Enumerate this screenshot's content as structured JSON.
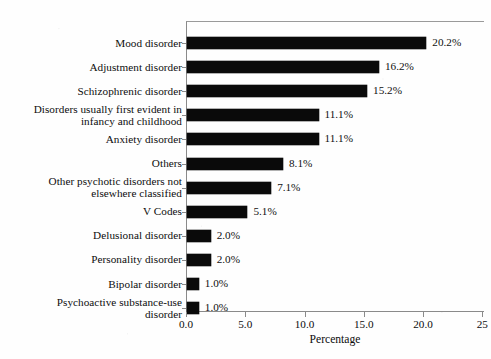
{
  "chart_data": {
    "type": "bar",
    "orientation": "horizontal",
    "title": "",
    "xlabel": "Percentage",
    "ylabel": "",
    "xlim": [
      0.0,
      25.0
    ],
    "xticks": [
      "0.0",
      "5.0",
      "10.0",
      "15.0",
      "20.0",
      "25"
    ],
    "xtick_values": [
      0.0,
      5.0,
      10.0,
      15.0,
      20.0,
      25.0
    ],
    "grid": false,
    "legend": null,
    "bar_color": "#0a0a0a",
    "categories": [
      "Mood disorder",
      "Adjustment disorder",
      "Schizophrenic disorder",
      "Disorders usually first evident in infancy and childhood",
      "Anxiety disorder",
      "Others",
      "Other psychotic disorders not elsewhere classified",
      "V Codes",
      "Delusional disorder",
      "Personality disorder",
      "Bipolar disorder",
      "Psychoactive substance-use disorder"
    ],
    "values": [
      20.2,
      16.2,
      15.2,
      11.1,
      11.1,
      8.1,
      7.1,
      5.1,
      2.0,
      2.0,
      1.0,
      1.0
    ],
    "value_labels": [
      "20.2%",
      "16.2%",
      "15.2%",
      "11.1%",
      "11.1%",
      "8.1%",
      "7.1%",
      "5.1%",
      "2.0%",
      "2.0%",
      "1.0%",
      "1.0%"
    ],
    "rows": [
      {
        "label_line1": "Mood disorder",
        "label_line2": "",
        "value": 20.2,
        "value_label": "20.2%"
      },
      {
        "label_line1": "Adjustment disorder",
        "label_line2": "",
        "value": 16.2,
        "value_label": "16.2%"
      },
      {
        "label_line1": "Schizophrenic disorder",
        "label_line2": "",
        "value": 15.2,
        "value_label": "15.2%"
      },
      {
        "label_line1": "Disorders usually first evident in",
        "label_line2": "infancy and childhood",
        "value": 11.1,
        "value_label": "11.1%"
      },
      {
        "label_line1": "Anxiety disorder",
        "label_line2": "",
        "value": 11.1,
        "value_label": "11.1%"
      },
      {
        "label_line1": "Others",
        "label_line2": "",
        "value": 8.1,
        "value_label": "8.1%"
      },
      {
        "label_line1": "Other psychotic disorders not",
        "label_line2": "elsewhere classified",
        "value": 7.1,
        "value_label": "7.1%"
      },
      {
        "label_line1": "V Codes",
        "label_line2": "",
        "value": 5.1,
        "value_label": "5.1%"
      },
      {
        "label_line1": "Delusional disorder",
        "label_line2": "",
        "value": 2.0,
        "value_label": "2.0%"
      },
      {
        "label_line1": "Personality disorder",
        "label_line2": "",
        "value": 2.0,
        "value_label": "2.0%"
      },
      {
        "label_line1": "Bipolar disorder",
        "label_line2": "",
        "value": 1.0,
        "value_label": "1.0%"
      },
      {
        "label_line1": "Psychoactive substance-use",
        "label_line2": "disorder",
        "value": 1.0,
        "value_label": "1.0%"
      }
    ]
  },
  "geometry": {
    "plot_left": 186,
    "plot_top": 21,
    "plot_right": 484,
    "axis_y": 311,
    "px_per_unit": 11.85,
    "row_height": 24.1,
    "row_first_center": 43
  }
}
